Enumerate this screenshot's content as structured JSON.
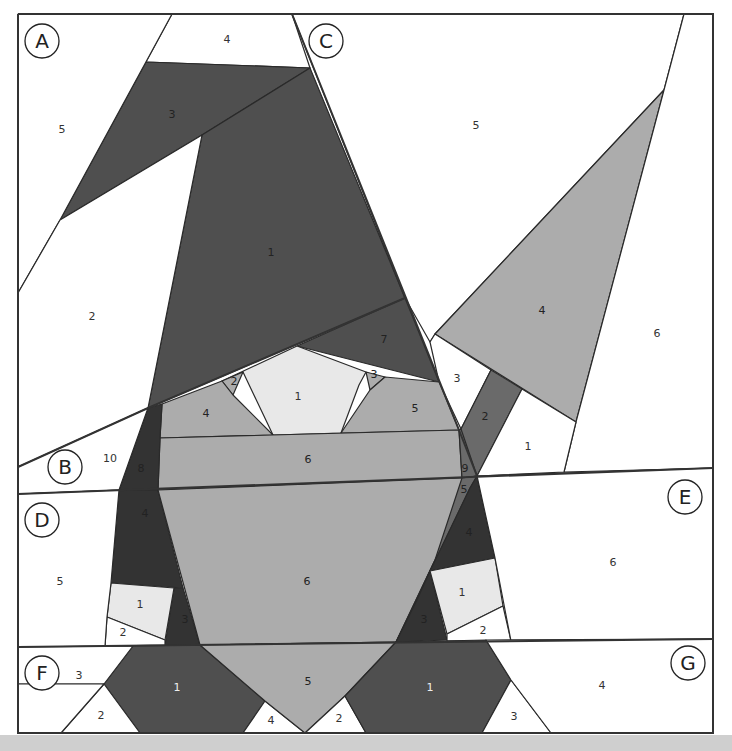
{
  "colors": {
    "background": "#ffffff",
    "border": "#333333",
    "very_dark": "#333333",
    "dark": "#4f4f4f",
    "medium_dark": "#6a6a6a",
    "medium": "#acacac",
    "light": "#e8e8e8",
    "white": "#ffffff",
    "bottom_bar": "#cfcfcf"
  },
  "sections": [
    {
      "letter": "A",
      "cx": 42,
      "cy": 41
    },
    {
      "letter": "B",
      "cx": 65,
      "cy": 467
    },
    {
      "letter": "C",
      "cx": 326,
      "cy": 41
    },
    {
      "letter": "D",
      "cx": 42,
      "cy": 520
    },
    {
      "letter": "E",
      "cx": 685,
      "cy": 497
    },
    {
      "letter": "F",
      "cx": 42,
      "cy": 673
    },
    {
      "letter": "G",
      "cx": 688,
      "cy": 663
    }
  ],
  "pieces": [
    {
      "section": "A",
      "num": "4",
      "fill": "white",
      "points": "172,14 292,14 310,68 146,62",
      "lx": 227,
      "ly": 40,
      "tcolor": "#333"
    },
    {
      "section": "A",
      "num": "3",
      "fill": "dark",
      "points": "146,62 310,68 202,135 60,220",
      "lx": 172,
      "ly": 115,
      "tcolor": "#222"
    },
    {
      "section": "A",
      "num": "5",
      "fill": "white",
      "points": "18,14 172,14 60,220 18,293",
      "lx": 62,
      "ly": 130,
      "tcolor": "#333"
    },
    {
      "section": "A",
      "num": "1",
      "fill": "dark",
      "points": "310,68 405,298 148,408 202,135",
      "lx": 271,
      "ly": 253,
      "tcolor": "#222"
    },
    {
      "section": "A",
      "num": "2",
      "fill": "white",
      "points": "60,220 202,135 148,408 18,467 18,293",
      "lx": 92,
      "ly": 317,
      "tcolor": "#333"
    },
    {
      "section": "C",
      "num": "5",
      "fill": "white",
      "points": "292,14 684,14 664,90 435,334 430,342 405,298",
      "lx": 476,
      "ly": 126,
      "tcolor": "#333"
    },
    {
      "section": "C",
      "num": "4",
      "fill": "medium",
      "points": "664,90 576,422 435,334",
      "lx": 542,
      "ly": 311,
      "tcolor": "#222"
    },
    {
      "section": "C",
      "num": "6",
      "fill": "white",
      "points": "684,14 713,14 713,468 564,472 576,422 664,90",
      "lx": 657,
      "ly": 334,
      "tcolor": "#333"
    },
    {
      "section": "C",
      "num": "7",
      "fill": "dark",
      "points": "405,298 439,382 297,346",
      "lx": 384,
      "ly": 340,
      "tcolor": "#222"
    },
    {
      "section": "C",
      "num": "3",
      "fill": "white",
      "points": "430,342 435,334 491,370 461,429 439,382",
      "lx": 457,
      "ly": 379,
      "tcolor": "#333"
    },
    {
      "section": "C",
      "num": "2",
      "fill": "medium_dark",
      "points": "491,370 522,389 477,476 462,478 461,429",
      "lx": 485,
      "ly": 417,
      "tcolor": "#222"
    },
    {
      "section": "C",
      "num": "1",
      "fill": "white",
      "points": "522,389 576,422 564,472 477,476",
      "lx": 528,
      "ly": 447,
      "tcolor": "#333"
    },
    {
      "section": "B",
      "num": "1",
      "fill": "light",
      "points": "297,346 366,372 359,385 341,433 273,435 243,372 222,381",
      "lx": 298,
      "ly": 397,
      "tcolor": "#333"
    },
    {
      "section": "B",
      "num": "2",
      "fill": "medium",
      "points": "222,381 243,372 233,395",
      "lx": 234,
      "ly": 382,
      "tcolor": "#222"
    },
    {
      "section": "B",
      "num": "3",
      "fill": "medium",
      "points": "366,372 385,377 370,390",
      "lx": 374,
      "ly": 375,
      "tcolor": "#222"
    },
    {
      "section": "B",
      "num": "4",
      "fill": "medium",
      "points": "162,404 222,381 233,395 273,435 160,438",
      "lx": 206,
      "ly": 414,
      "tcolor": "#222"
    },
    {
      "section": "B",
      "num": "5",
      "fill": "medium",
      "points": "385,377 439,382 459,430 341,433 370,390",
      "lx": 415,
      "ly": 409,
      "tcolor": "#222"
    },
    {
      "section": "B",
      "num": "6",
      "fill": "medium",
      "points": "160,438 459,430 462,478 158,490",
      "lx": 308,
      "ly": 460,
      "tcolor": "#222"
    },
    {
      "section": "B",
      "num": "8",
      "fill": "very_dark",
      "points": "148,408 162,404 160,438 158,490 119,490",
      "lx": 141,
      "ly": 469,
      "tcolor": "#222"
    },
    {
      "section": "B",
      "num": "9",
      "fill": "medium_dark",
      "points": "459,430 461,429 477,476 462,478",
      "lx": 465,
      "ly": 469,
      "tcolor": "#222"
    },
    {
      "section": "B",
      "num": "10",
      "fill": "white",
      "points": "18,467 148,408 119,490 18,494",
      "lx": 110,
      "ly": 459,
      "tcolor": "#333"
    },
    {
      "section": "D",
      "num": "4",
      "fill": "very_dark",
      "points": "119,490 158,490 183,588 111,583",
      "lx": 145,
      "ly": 514,
      "tcolor": "#222"
    },
    {
      "section": "D",
      "num": "3",
      "fill": "very_dark",
      "points": "174,588 183,588 200,645 165,645",
      "lx": 185,
      "ly": 620,
      "tcolor": "#222"
    },
    {
      "section": "D",
      "num": "1",
      "fill": "light",
      "points": "111,583 174,588 165,640 107,617",
      "lx": 140,
      "ly": 605,
      "tcolor": "#333"
    },
    {
      "section": "D",
      "num": "2",
      "fill": "white",
      "points": "107,617 165,640 165,645 105,646",
      "lx": 123,
      "ly": 633,
      "tcolor": "#333"
    },
    {
      "section": "D",
      "num": "5",
      "fill": "white",
      "points": "18,494 119,490 111,583 107,617 105,646 18,647",
      "lx": 60,
      "ly": 582,
      "tcolor": "#333"
    },
    {
      "section": "D",
      "num": "6",
      "fill": "medium",
      "points": "158,490 462,478 477,476 435,560 396,642 200,645",
      "lx": 307,
      "ly": 582,
      "tcolor": "#222"
    },
    {
      "section": "E",
      "num": "5",
      "fill": "medium_dark",
      "points": "462,478 477,476 470,488 417,600 396,642 435,560",
      "lx": 464,
      "ly": 490,
      "tcolor": "#222"
    },
    {
      "section": "E",
      "num": "4",
      "fill": "very_dark",
      "points": "477,476 495,558 430,571 470,488",
      "lx": 469,
      "ly": 533,
      "tcolor": "#222"
    },
    {
      "section": "E",
      "num": "3",
      "fill": "very_dark",
      "points": "430,571 447,640 396,642 417,600",
      "lx": 424,
      "ly": 620,
      "tcolor": "#222"
    },
    {
      "section": "E",
      "num": "1",
      "fill": "light",
      "points": "430,571 495,558 503,606 447,634",
      "lx": 462,
      "ly": 593,
      "tcolor": "#333"
    },
    {
      "section": "E",
      "num": "2",
      "fill": "white",
      "points": "447,634 503,606 511,641 447,641",
      "lx": 483,
      "ly": 631,
      "tcolor": "#333"
    },
    {
      "section": "E",
      "num": "6",
      "fill": "white",
      "points": "477,476 713,468 713,639 511,641 495,558",
      "lx": 613,
      "ly": 563,
      "tcolor": "#333"
    },
    {
      "section": "F",
      "num": "1",
      "fill": "dark",
      "points": "133,646 200,645 265,701 243,733 140,733 104,684",
      "lx": 177,
      "ly": 688,
      "tcolor": "#eee"
    },
    {
      "section": "F",
      "num": "3",
      "fill": "white",
      "points": "18,647 133,646 104,684 18,684",
      "lx": 79,
      "ly": 676,
      "tcolor": "#333"
    },
    {
      "section": "F",
      "num": "2",
      "fill": "white",
      "points": "104,684 140,733 61,733",
      "lx": 101,
      "ly": 716,
      "tcolor": "#333"
    },
    {
      "section": "F",
      "num": "4",
      "fill": "white",
      "points": "265,701 305,733 243,733",
      "lx": 271,
      "ly": 721,
      "tcolor": "#333"
    },
    {
      "section": "F",
      "num": "5",
      "fill": "medium",
      "points": "200,645 396,642 345,696 305,733 265,701",
      "lx": 308,
      "ly": 682,
      "tcolor": "#222"
    },
    {
      "section": "F",
      "num": "0",
      "fill": "white",
      "points": "18,684 104,684 61,733 18,733",
      "lx": -100,
      "ly": -100,
      "tcolor": "#333"
    },
    {
      "section": "G",
      "num": "2",
      "fill": "white",
      "points": "345,696 366,733 305,733",
      "lx": 339,
      "ly": 719,
      "tcolor": "#333"
    },
    {
      "section": "G",
      "num": "1",
      "fill": "dark",
      "points": "396,642 486,640 511,680 482,733 366,733 345,696",
      "lx": 430,
      "ly": 688,
      "tcolor": "#eee"
    },
    {
      "section": "G",
      "num": "3",
      "fill": "white",
      "points": "511,680 551,733 482,733",
      "lx": 514,
      "ly": 717,
      "tcolor": "#333"
    },
    {
      "section": "G",
      "num": "4",
      "fill": "white",
      "points": "486,640 713,639 713,733 551,733 511,680",
      "lx": 602,
      "ly": 686,
      "tcolor": "#333"
    }
  ],
  "lines": [
    {
      "name": "outer-border",
      "points": "18,14 713,14 713,733 18,733 18,14"
    },
    {
      "name": "seam-AB",
      "points": "18,467 148,408 405,298"
    },
    {
      "name": "seam-AC",
      "points": "292,14 459,430 477,476"
    },
    {
      "name": "seam-BD-E",
      "points": "18,494 713,468"
    },
    {
      "name": "seam-DF-G",
      "points": "18,647 713,639"
    }
  ]
}
